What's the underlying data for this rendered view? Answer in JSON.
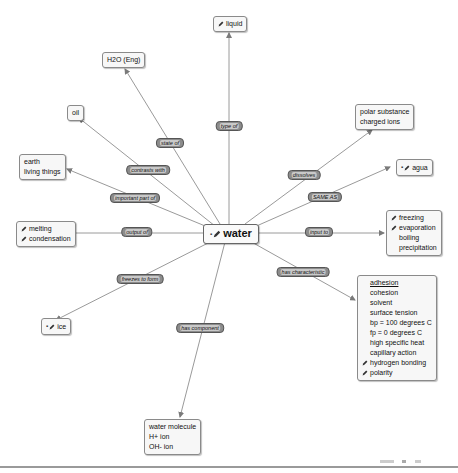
{
  "center": {
    "label": "water",
    "icons": [
      "dash-icon",
      "pencil-icon"
    ]
  },
  "nodes": {
    "liquid": {
      "lines": [
        "liquid"
      ],
      "icons": [
        "pencil-icon"
      ]
    },
    "h2o": {
      "lines": [
        "H2O (Eng)"
      ]
    },
    "oil": {
      "lines": [
        "oil"
      ]
    },
    "earth": {
      "lines": [
        "earth",
        "living things"
      ]
    },
    "melting": {
      "lines": [
        "melting",
        "condensation"
      ],
      "icons": [
        "pencil-icon",
        "pencil-icon"
      ]
    },
    "ice": {
      "lines": [
        "ice"
      ],
      "icons": [
        "dash-icon",
        "pencil-icon"
      ]
    },
    "molecule": {
      "lines": [
        "water molecule",
        "H+ ion",
        "OH- ion"
      ]
    },
    "polar": {
      "lines": [
        "polar substance",
        "charged ions"
      ]
    },
    "agua": {
      "lines": [
        "agua"
      ],
      "icons": [
        "dash-icon",
        "pencil-icon"
      ]
    },
    "freezing": {
      "lines": [
        "freezing",
        "evaporation",
        "boiling",
        "precipitation"
      ]
    },
    "properties": {
      "lines": [
        "adhesion",
        "cohesion",
        "solvent",
        "surface tension",
        "bp = 100 degrees C",
        "fp = 0 degrees C",
        "high specific heat",
        "capillary action",
        "hydrogen bonding",
        "polarity"
      ]
    }
  },
  "links": {
    "type_of": "type of",
    "state_of": "state of",
    "contrasts_with": "contrasts with",
    "important_part_of": "important part of",
    "output_of": "output of",
    "freezes_to_form": "freezes to form",
    "has_component": "has component",
    "dissolves": "dissolves",
    "same_as": "SAME AS",
    "input_to": "input to",
    "has_characteristic": "has characteristic"
  },
  "colors": {
    "edge": "#8a8a8a",
    "node_bg": "#f7f7f7",
    "node_border": "#8a8a8a",
    "link_bg": "#8c8c8c"
  }
}
